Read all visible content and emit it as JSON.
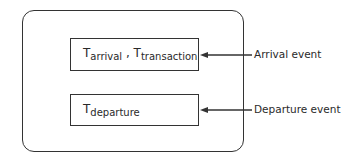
{
  "diagram": {
    "boxes": [
      {
        "terms": [
          {
            "symbol": "T",
            "subscript": "arrival"
          },
          {
            "separator": " , "
          },
          {
            "symbol": "T",
            "subscript": "transaction"
          }
        ]
      },
      {
        "terms": [
          {
            "symbol": "T",
            "subscript": "departure"
          }
        ]
      }
    ],
    "events": [
      {
        "label": "Arrival event",
        "target_box": 0
      },
      {
        "label": "Departure event",
        "target_box": 1
      }
    ]
  }
}
